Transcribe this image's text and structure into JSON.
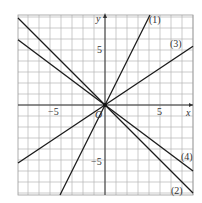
{
  "chart_data": {
    "type": "line",
    "title": "",
    "xlabel": "x",
    "ylabel": "y",
    "origin_label": "O",
    "xlim": [
      -8,
      8
    ],
    "ylim": [
      -8.2,
      8.2
    ],
    "grid": true,
    "x_ticks": [
      {
        "value": -5,
        "label": "−5"
      },
      {
        "value": 5,
        "label": "5"
      }
    ],
    "y_ticks": [
      {
        "value": 5,
        "label": "5"
      },
      {
        "value": -5,
        "label": "−5"
      }
    ],
    "series": [
      {
        "name": "(1)",
        "slope": 2,
        "intercept": 0,
        "label_pos": [
          4.6,
          7.9
        ]
      },
      {
        "name": "(2)",
        "slope": -1,
        "intercept": 0,
        "label_pos": [
          6.7,
          -7.7
        ]
      },
      {
        "name": "(3)",
        "slope": 0.6667,
        "intercept": 0,
        "label_pos": [
          6.6,
          5.5
        ]
      },
      {
        "name": "(4)",
        "slope": -0.75,
        "intercept": 0,
        "label_pos": [
          7.0,
          -4.8
        ]
      }
    ]
  },
  "labels": {
    "x_axis": "x",
    "y_axis": "y",
    "origin": "O",
    "tick_x_neg5": "−5",
    "tick_x_5": "5",
    "tick_y_5": "5",
    "tick_y_neg5": "−5",
    "line1": "(1)",
    "line2": "(2)",
    "line3": "(3)",
    "line4": "(4)"
  },
  "colors": {
    "grid": "#b4b4b4",
    "axis": "#333333",
    "line": "#1a1a1a"
  }
}
